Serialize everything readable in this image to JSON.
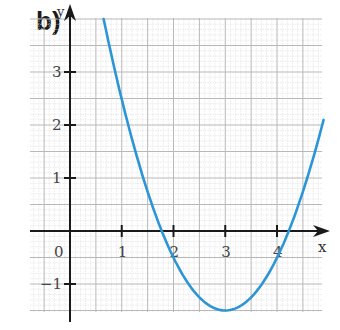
{
  "panel_label": "b)",
  "chart_data": {
    "type": "line",
    "title": "",
    "panel_label": "b)",
    "xlabel": "x",
    "ylabel": "y",
    "xlim": [
      -0.75,
      4.9
    ],
    "ylim": [
      -1.55,
      4.0
    ],
    "grid": true,
    "grid_major_step": 0.5,
    "grid_minor_step": 0.1,
    "x_ticks": [
      0,
      1,
      2,
      3,
      4
    ],
    "x_tick_labels": [
      "0",
      "1",
      "2",
      "3",
      "4"
    ],
    "y_ticks": [
      -1,
      1,
      2,
      3
    ],
    "y_tick_labels": [
      "−1",
      "1",
      "2",
      "3"
    ],
    "series": [
      {
        "name": "parabola",
        "color": "#2b95d6",
        "equation": "y = x^2 - 6x + 7.5",
        "vertex": [
          3,
          -1.5
        ],
        "roots": [
          1.78,
          4.22
        ],
        "x": [
          0.65,
          1.0,
          1.5,
          1.78,
          2.0,
          2.5,
          3.0,
          3.5,
          4.0,
          4.22,
          4.5,
          4.9
        ],
        "y": [
          4.0,
          2.5,
          0.75,
          0.0,
          -0.5,
          -1.25,
          -1.5,
          -1.25,
          -0.5,
          0.0,
          0.75,
          2.1
        ]
      }
    ]
  },
  "colors": {
    "curve": "#2b95d6",
    "axis": "#1a1a1a",
    "grid_major": "#b8b8b8",
    "grid_minor": "#dedede"
  }
}
